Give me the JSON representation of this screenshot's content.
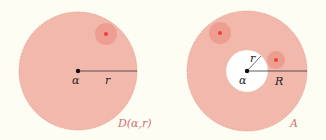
{
  "figure": {
    "colors": {
      "background": "#fdfdf3",
      "region_fill": "#f2b8ac",
      "region_edge": "#e08f80",
      "point_halo": "#ec9488",
      "point_core": "#e8453c",
      "line": "#333333",
      "caption": "#d07070"
    },
    "left": {
      "title": "disk",
      "center_label": "α",
      "radius_label": "r",
      "caption": "D(α,r)"
    },
    "right": {
      "title": "annulus",
      "center_label": "α",
      "inner_radius_label": "r",
      "outer_radius_label": "R",
      "caption": "A"
    }
  }
}
